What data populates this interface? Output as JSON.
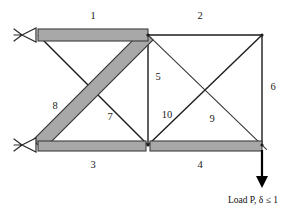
{
  "figure": {
    "type": "structural-truss-diagram",
    "colors": {
      "thick_member_fill": "#a8a8a8",
      "thick_member_stroke": "#3c3c3c",
      "thin_member_stroke": "#1c1c1c",
      "label_color": "#1a1a1a",
      "background": "#ffffff",
      "load_arrow": "#000000"
    }
  },
  "nodes": [
    {
      "id": "top-left",
      "x": 38,
      "y": 35
    },
    {
      "id": "top-mid",
      "x": 148,
      "y": 35
    },
    {
      "id": "top-right",
      "x": 262,
      "y": 35
    },
    {
      "id": "bottom-left",
      "x": 38,
      "y": 145
    },
    {
      "id": "bottom-mid",
      "x": 148,
      "y": 145
    },
    {
      "id": "bottom-right",
      "x": 262,
      "y": 145
    }
  ],
  "members": [
    {
      "id": 1,
      "label": "1",
      "from": "top-left",
      "to": "top-mid",
      "style": "thick",
      "label_x": 93,
      "label_y": 17
    },
    {
      "id": 2,
      "label": "2",
      "from": "top-mid",
      "to": "top-right",
      "style": "thin",
      "label_x": 200,
      "label_y": 17
    },
    {
      "id": 3,
      "label": "3",
      "from": "bottom-left",
      "to": "bottom-mid",
      "style": "thick",
      "label_x": 93,
      "label_y": 166
    },
    {
      "id": 4,
      "label": "4",
      "from": "bottom-mid",
      "to": "bottom-right",
      "style": "thick",
      "label_x": 200,
      "label_y": 166
    },
    {
      "id": 5,
      "label": "5",
      "from": "top-mid",
      "to": "bottom-mid",
      "style": "thin",
      "label_x": 158,
      "label_y": 78
    },
    {
      "id": 6,
      "label": "6",
      "from": "top-right",
      "to": "bottom-right",
      "style": "thin",
      "label_x": 273,
      "label_y": 88
    },
    {
      "id": 7,
      "label": "7",
      "from": "top-left",
      "to": "bottom-mid",
      "style": "thin",
      "label_x": 110,
      "label_y": 118
    },
    {
      "id": 8,
      "label": "8",
      "from": "bottom-left",
      "to": "top-mid",
      "style": "thick",
      "label_x": 55,
      "label_y": 107
    },
    {
      "id": 9,
      "label": "9",
      "from": "top-mid",
      "to": "bottom-right",
      "style": "thick",
      "label_x": 212,
      "label_y": 120
    },
    {
      "id": 10,
      "label": "10",
      "from": "bottom-mid",
      "to": "top-right",
      "style": "thin",
      "label_x": 167,
      "label_y": 116
    }
  ],
  "supports": [
    {
      "id": "support-top-left",
      "node": "top-left",
      "type": "pin"
    },
    {
      "id": "support-bottom-left",
      "node": "bottom-left",
      "type": "pin"
    }
  ],
  "load": {
    "node": "bottom-right",
    "caption": "Load P, δ ≤ 1",
    "caption_x": 253,
    "caption_y": 201,
    "arrow_from_y": 150,
    "arrow_to_y": 186
  }
}
